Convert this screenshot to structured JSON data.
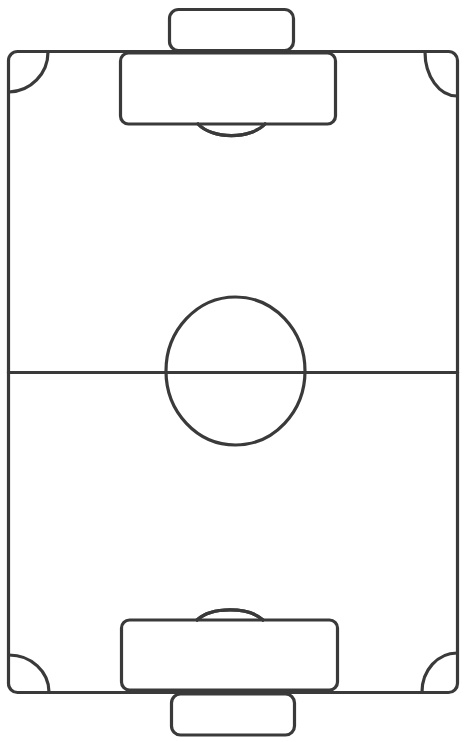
{
  "diagram": {
    "type": "soccer-field",
    "orientation": "vertical",
    "line_color": "#3a3a3a",
    "background_color": "#ffffff",
    "elements": [
      "outer-boundary",
      "halfway-line",
      "center-circle",
      "top-goal",
      "top-penalty-box",
      "top-penalty-arc",
      "bottom-goal",
      "bottom-penalty-box",
      "bottom-penalty-arc",
      "corner-arc-top-left",
      "corner-arc-top-right",
      "corner-arc-bottom-left",
      "corner-arc-bottom-right"
    ]
  }
}
